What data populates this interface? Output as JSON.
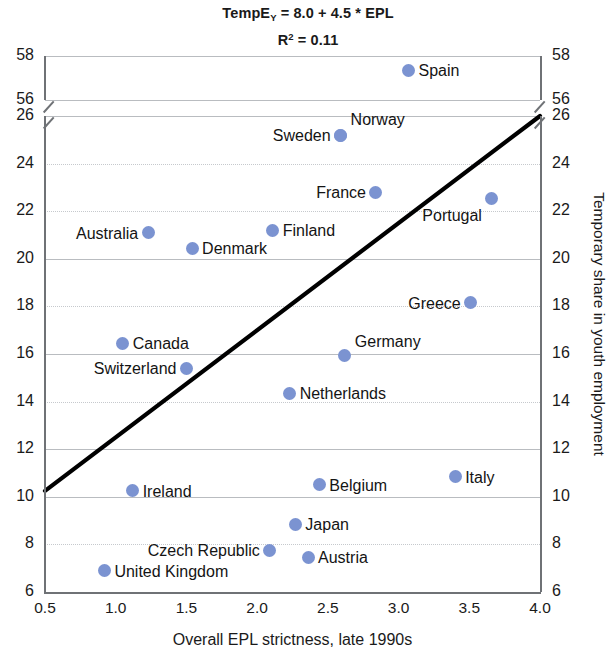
{
  "chart_data": {
    "type": "scatter",
    "title_main_prefix": "TempE",
    "title_main_subscript": "Y",
    "title_main_suffix": " = 8.0 + 4.5 * EPL",
    "title_r2_prefix": "R",
    "title_r2_superscript": "2",
    "title_r2_suffix": " = 0.11",
    "subtitle": "R² = 0.11",
    "xlabel": "Overall EPL strictness, late 1990s",
    "ylabel_right": "Temporary share in youth employment",
    "xlim": [
      0.5,
      4.0
    ],
    "xticks": [
      "0.5",
      "1.0",
      "1.5",
      "2.0",
      "2.5",
      "3.0",
      "3.5",
      "4.0"
    ],
    "xtick_values": [
      0.5,
      1.0,
      1.5,
      2.0,
      2.5,
      3.0,
      3.5,
      4.0
    ],
    "yticks": [
      "6",
      "8",
      "10",
      "12",
      "14",
      "16",
      "18",
      "20",
      "22",
      "24",
      "26",
      "56",
      "58"
    ],
    "ytick_values": [
      6,
      8,
      10,
      12,
      14,
      16,
      18,
      20,
      22,
      24,
      26,
      56,
      58
    ],
    "y_axis_break": {
      "between": [
        26,
        56
      ],
      "present": true
    },
    "grid": true,
    "legend": "none",
    "marker_color": "#7b93d1",
    "trendline_color": "#000000",
    "trendline": {
      "slope": 4.5,
      "intercept": 8.0,
      "x_start": 0.5,
      "y_start": 10.25,
      "x_end": 4.0,
      "y_end": 26.0
    },
    "points": [
      {
        "label": "Spain",
        "x": 3.07,
        "y": 57.35,
        "label_side": "right"
      },
      {
        "label": "Norway",
        "x": 2.59,
        "y": 25.2,
        "label_side": "right",
        "label_dy": -16
      },
      {
        "label": "Sweden",
        "x": 2.59,
        "y": 25.2,
        "label_side": "left"
      },
      {
        "label": "France",
        "x": 2.84,
        "y": 22.8,
        "label_side": "left"
      },
      {
        "label": "Portugal",
        "x": 3.66,
        "y": 22.55,
        "label_side": "left",
        "label_dy": 17
      },
      {
        "label": "Finland",
        "x": 2.11,
        "y": 21.2,
        "label_side": "right"
      },
      {
        "label": "Australia",
        "x": 1.23,
        "y": 21.1,
        "label_side": "left"
      },
      {
        "label": "Denmark",
        "x": 1.54,
        "y": 20.45,
        "label_side": "right"
      },
      {
        "label": "Greece",
        "x": 3.51,
        "y": 18.15,
        "label_side": "left"
      },
      {
        "label": "Canada",
        "x": 1.05,
        "y": 16.45,
        "label_side": "right"
      },
      {
        "label": "Germany",
        "x": 2.62,
        "y": 15.95,
        "label_side": "right",
        "label_dy": -14
      },
      {
        "label": "Switzerland",
        "x": 1.5,
        "y": 15.4,
        "label_side": "left"
      },
      {
        "label": "Netherlands",
        "x": 2.23,
        "y": 14.35,
        "label_side": "right"
      },
      {
        "label": "Italy",
        "x": 3.4,
        "y": 10.85,
        "label_side": "right"
      },
      {
        "label": "Belgium",
        "x": 2.44,
        "y": 10.5,
        "label_side": "right"
      },
      {
        "label": "Ireland",
        "x": 1.12,
        "y": 10.25,
        "label_side": "right"
      },
      {
        "label": "Japan",
        "x": 2.27,
        "y": 8.85,
        "label_side": "right"
      },
      {
        "label": "Czech Republic",
        "x": 2.09,
        "y": 7.75,
        "label_side": "left"
      },
      {
        "label": "Austria",
        "x": 2.36,
        "y": 7.45,
        "label_side": "right"
      },
      {
        "label": "United Kingdom",
        "x": 0.92,
        "y": 6.9,
        "label_side": "right"
      }
    ]
  }
}
